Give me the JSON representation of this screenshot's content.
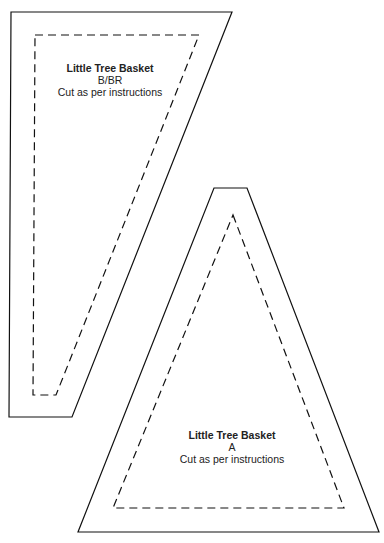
{
  "pieces": [
    {
      "id": "B",
      "title": "Little Tree Basket",
      "code": "B/BR",
      "instruction": "Cut as per instructions"
    },
    {
      "id": "A",
      "title": "Little Tree Basket",
      "code": "A",
      "instruction": "Cut as per instructions"
    }
  ],
  "colors": {
    "line": "#111111",
    "paper": "#ffffff"
  }
}
